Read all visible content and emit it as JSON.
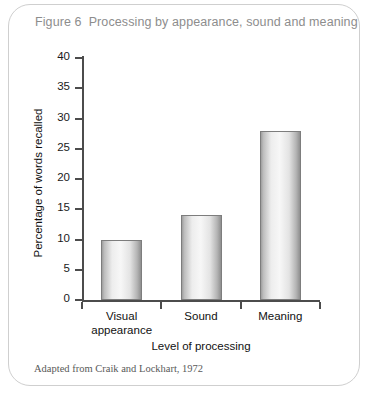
{
  "figure": {
    "number": "Figure 6",
    "title": "Processing by appearance, sound and meaning",
    "source": "Adapted from Craik and Lockhart, 1972"
  },
  "chart_data": {
    "type": "bar",
    "title": "Processing by appearance, sound and meaning",
    "categories": [
      "Visual appearance",
      "Sound",
      "Meaning"
    ],
    "category_lines": [
      [
        "Visual",
        "appearance"
      ],
      [
        "Sound",
        ""
      ],
      [
        "Meaning",
        ""
      ]
    ],
    "values": [
      10,
      14,
      28
    ],
    "xlabel": "Level of processing",
    "ylabel": "Percentage of words recalled",
    "ylim": [
      0,
      40
    ],
    "yticks": [
      0,
      5,
      10,
      15,
      20,
      25,
      30,
      35,
      40
    ],
    "ytick_labels": [
      "0",
      "5",
      "10",
      "15",
      "20",
      "25",
      "30",
      "35",
      "40"
    ],
    "grid": false,
    "legend": "none",
    "bar_color": "#e8e8e8",
    "bar_edge_color": "#7d7d7d"
  },
  "colors": {
    "card_border": "#cfcfcf",
    "title_text": "#8d8d8d",
    "axis": "#4c4c4c",
    "body_text": "#111111",
    "source_text": "#595959"
  }
}
